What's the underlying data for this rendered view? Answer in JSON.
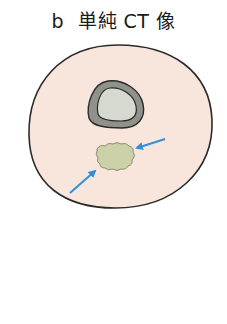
{
  "figure": {
    "panel_label": "b",
    "title": "単純 CT 像",
    "colors": {
      "soft_tissue_fill": "#f8e6dc",
      "outline": "#2a2a2a",
      "cortex_fill": "#8f918a",
      "marrow_fill": "#d6d9cf",
      "lesion_fill": "#cdd1a8",
      "lesion_outline": "#8a8c72",
      "arrow": "#2f8fd8"
    },
    "elements": [
      {
        "name": "soft-tissue-cross-section",
        "shape": "oval"
      },
      {
        "name": "bone",
        "parts": [
          "cortex",
          "medullary-cavity"
        ]
      },
      {
        "name": "lesion",
        "description": "soft tissue mass below bone"
      },
      {
        "name": "arrow",
        "direction": "pointing left-down toward lesion"
      },
      {
        "name": "arrow",
        "direction": "pointing right-up toward lesion"
      }
    ]
  }
}
